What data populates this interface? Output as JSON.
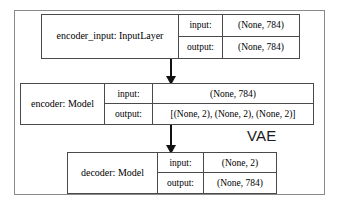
{
  "diagram": {
    "container_label": "VAE",
    "nodes": [
      {
        "id": "encoder-input",
        "name": "encoder_input: InputLayer",
        "input_label": "input:",
        "input_value": "(None, 784)",
        "output_label": "output:",
        "output_value": "(None, 784)"
      },
      {
        "id": "encoder",
        "name": "encoder: Model",
        "input_label": "input:",
        "input_value": "(None, 784)",
        "output_label": "output:",
        "output_value": "[(None, 2), (None, 2), (None, 2)]"
      },
      {
        "id": "decoder",
        "name": "decoder: Model",
        "input_label": "input:",
        "input_value": "(None, 2)",
        "output_label": "output:",
        "output_value": "(None, 784)"
      }
    ],
    "edges": [
      {
        "from": "encoder-input",
        "to": "encoder"
      },
      {
        "from": "encoder",
        "to": "decoder"
      }
    ],
    "colors": {
      "box_border": "#4a4a4a",
      "frame_border": "#8a8a8a",
      "arrow": "#111111",
      "background": "#ffffff",
      "text": "#1a1a1a"
    }
  }
}
